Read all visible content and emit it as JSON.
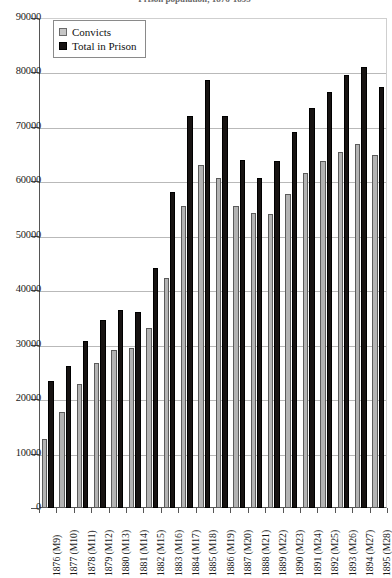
{
  "chart_data": {
    "type": "bar",
    "title": "Prison population, 1876-1895",
    "xlabel": "",
    "ylabel": "",
    "ylim": [
      0,
      90000
    ],
    "ytick_step": 10000,
    "yticks": [
      "0",
      "10000",
      "20000",
      "30000",
      "40000",
      "50000",
      "60000",
      "70000",
      "80000",
      "90000"
    ],
    "grid": true,
    "legend_position": "top-left",
    "categories": [
      "1876 (M9)",
      "1877 (M10)",
      "1878 (M11)",
      "1879 (M12)",
      "1880 (M13)",
      "1881 (M14)",
      "1882 (M15)",
      "1883 (M16)",
      "1884 (M17)",
      "1885 (M18)",
      "1886 (M19)",
      "1887 (M20)",
      "1888 (M21)",
      "1889 (M22)",
      "1890 (M23)",
      "1891 (M24)",
      "1892 (M25)",
      "1893 (M26)",
      "1894 (M27)",
      "1895 (M28)"
    ],
    "series": [
      {
        "name": "Convicts",
        "color": "#b3b3b3",
        "values": [
          12700,
          17700,
          22700,
          26700,
          29100,
          29300,
          33000,
          42300,
          55400,
          63000,
          60700,
          55400,
          54200,
          54000,
          57700,
          61500,
          63800,
          65400,
          66800,
          64800
        ]
      },
      {
        "name": "Total in Prison",
        "color": "#171312",
        "values": [
          23300,
          26000,
          30700,
          34600,
          36300,
          36000,
          44000,
          58000,
          72000,
          78700,
          72000,
          64000,
          60700,
          63700,
          69000,
          73500,
          76400,
          79500,
          81000,
          77400
        ]
      }
    ]
  },
  "legend": {
    "items": [
      {
        "label": "Convicts",
        "swatch": "convicts"
      },
      {
        "label": "Total in Prison",
        "swatch": "total"
      }
    ]
  }
}
